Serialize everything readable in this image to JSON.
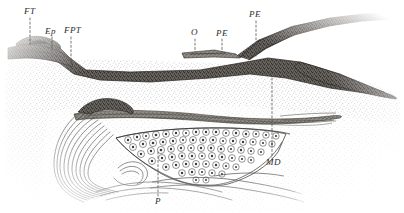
{
  "figure": {
    "kind": "anatomical-line-engraving",
    "background_color": "#ffffff",
    "ink_color": "#3a3a3a",
    "width": 404,
    "height": 213
  },
  "labels": [
    {
      "id": "ft",
      "text": "FT",
      "x": 24,
      "y": 14,
      "leader": {
        "x1": 30,
        "y1": 18,
        "x2": 30,
        "y2": 44
      }
    },
    {
      "id": "ep",
      "text": "Ep",
      "x": 45,
      "y": 34,
      "leader": {
        "x1": 52,
        "y1": 37,
        "x2": 52,
        "y2": 50
      }
    },
    {
      "id": "fpt",
      "text": "FPT",
      "x": 64,
      "y": 33,
      "leader": {
        "x1": 71,
        "y1": 37,
        "x2": 71,
        "y2": 72
      }
    },
    {
      "id": "o",
      "text": "O",
      "x": 191,
      "y": 35,
      "leader": {
        "x1": 195,
        "y1": 39,
        "x2": 195,
        "y2": 52
      }
    },
    {
      "id": "pe1",
      "text": "PE",
      "x": 216,
      "y": 36,
      "leader": {
        "x1": 222,
        "y1": 39,
        "x2": 222,
        "y2": 52
      }
    },
    {
      "id": "pe2",
      "text": "PE",
      "x": 249,
      "y": 17,
      "leader": {
        "x1": 256,
        "y1": 21,
        "x2": 256,
        "y2": 56
      }
    },
    {
      "id": "md",
      "text": "MD",
      "x": 266,
      "y": 165,
      "leader": {
        "x1": 272,
        "y1": 78,
        "x2": 272,
        "y2": 158
      }
    },
    {
      "id": "p",
      "text": "P",
      "x": 155,
      "y": 204,
      "leader": {
        "x1": 158,
        "y1": 152,
        "x2": 158,
        "y2": 196
      }
    }
  ],
  "legend_keys": {
    "FT": "FT",
    "Ep": "Ep",
    "FPT": "FPT",
    "O": "O",
    "PE": "PE",
    "MD": "MD",
    "P": "P"
  }
}
